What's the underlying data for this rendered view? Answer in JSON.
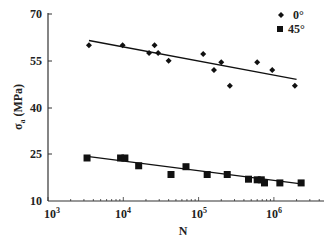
{
  "chart_data": {
    "type": "scatter",
    "title": "",
    "xlabel": "N",
    "ylabel": "σa (MPa)",
    "xscale": "log",
    "xlim": [
      1000,
      3500000
    ],
    "ylim": [
      10,
      70
    ],
    "xticks": [
      1000,
      10000,
      100000,
      1000000
    ],
    "xtick_labels": [
      "10^3",
      "10^4",
      "10^5",
      "10^6"
    ],
    "yticks": [
      10,
      25,
      40,
      55,
      70
    ],
    "ytick_labels": [
      "10",
      "25",
      "40",
      "55",
      "70"
    ],
    "grid": false,
    "legend_position": "upper right",
    "series": [
      {
        "name": "0°",
        "marker": "diamond",
        "points": [
          {
            "x": 3500,
            "y": 60
          },
          {
            "x": 9800,
            "y": 60
          },
          {
            "x": 22000,
            "y": 57.5
          },
          {
            "x": 26000,
            "y": 60
          },
          {
            "x": 29000,
            "y": 57.5
          },
          {
            "x": 40000,
            "y": 55
          },
          {
            "x": 115000,
            "y": 57.2
          },
          {
            "x": 160000,
            "y": 52
          },
          {
            "x": 200000,
            "y": 54.5
          },
          {
            "x": 260000,
            "y": 47
          },
          {
            "x": 600000,
            "y": 54.5
          },
          {
            "x": 950000,
            "y": 52
          },
          {
            "x": 1900000,
            "y": 47
          }
        ],
        "trendline": {
          "x": [
            3500,
            2000000
          ],
          "y": [
            61.5,
            49
          ]
        }
      },
      {
        "name": "45°",
        "marker": "square",
        "points": [
          {
            "x": 3300,
            "y": 23.8
          },
          {
            "x": 9200,
            "y": 23.8
          },
          {
            "x": 10500,
            "y": 23.8
          },
          {
            "x": 16000,
            "y": 21.3
          },
          {
            "x": 43000,
            "y": 18.5
          },
          {
            "x": 68000,
            "y": 21
          },
          {
            "x": 130000,
            "y": 18.5
          },
          {
            "x": 240000,
            "y": 18.5
          },
          {
            "x": 460000,
            "y": 17
          },
          {
            "x": 600000,
            "y": 16.8
          },
          {
            "x": 680000,
            "y": 16.8
          },
          {
            "x": 750000,
            "y": 15.8
          },
          {
            "x": 1200000,
            "y": 15.8
          },
          {
            "x": 2300000,
            "y": 15.8
          }
        ],
        "trendline": {
          "x": [
            3300,
            2300000
          ],
          "y": [
            24.3,
            15.5
          ]
        }
      }
    ]
  },
  "legend": {
    "items": [
      {
        "label": "0°",
        "marker": "diamond"
      },
      {
        "label": "45°",
        "marker": "square"
      }
    ]
  },
  "axes": {
    "xlabel": "N",
    "ylabel_main": "σ",
    "ylabel_sub": "a",
    "ylabel_unit": "(MPa)",
    "xtick_base": "10",
    "xtick_exps": [
      "3",
      "4",
      "5",
      "6"
    ],
    "yticks": [
      "70",
      "55",
      "40",
      "25",
      "10"
    ]
  },
  "colors": {
    "marker": "#111111",
    "line": "#111111",
    "axis": "#333333"
  }
}
